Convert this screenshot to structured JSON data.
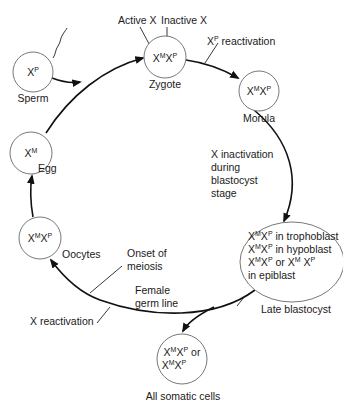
{
  "colors": {
    "line": "#111111",
    "circle_stroke": "#777777",
    "text": "#1a1a1a",
    "background": "#ffffff"
  },
  "nodes": {
    "sperm": {
      "label": "Sperm",
      "genotype": {
        "x1": "X",
        "s1": "P"
      }
    },
    "zygote": {
      "label": "Zygote",
      "genotype": {
        "x1": "X",
        "s1": "M",
        "x2": "X",
        "s2": "P"
      }
    },
    "morula": {
      "label": "Morula",
      "genotype": {
        "x1": "X",
        "s1": "M",
        "x2": "X",
        "s2": "P"
      }
    },
    "egg": {
      "label": "Egg",
      "genotype": {
        "x1": "X",
        "s1": "M"
      }
    },
    "oocytes": {
      "label": "Oocytes",
      "genotype": {
        "x1": "X",
        "s1": "M",
        "x2": "X",
        "s2": "P"
      }
    },
    "late_blastocyst": {
      "label": "Late blastocyst",
      "lines": [
        {
          "x1": "X",
          "s1": "M",
          "x2": "X",
          "s2": "P",
          "text": " in trophoblast"
        },
        {
          "x1": "X",
          "s1": "M",
          "x2": "X",
          "s2": "P",
          "text": " in hypoblast"
        },
        {
          "x1": "X",
          "s1": "M",
          "x2": "X",
          "s2": "P",
          "mid": " or ",
          "x3": "X",
          "s3": "M",
          "x4": " X",
          "s4": "P"
        },
        {
          "text": "in epiblast"
        }
      ]
    },
    "somatic": {
      "label": "All somatic cells",
      "line1": {
        "x1": "X",
        "s1": "M",
        "x2": "X",
        "s2": "P",
        "text": " or"
      },
      "line2": {
        "x1": "X",
        "s1": "M",
        "x2": "X",
        "s2": "P"
      }
    }
  },
  "annotations": {
    "active_x": "Active X",
    "inactive_x": "Inactive X",
    "xp_reactivation": {
      "x": "X",
      "sup": "P",
      "text": " reactivation"
    },
    "x_inactivation": [
      "X inactivation",
      "during",
      "blastocyst",
      "stage"
    ],
    "onset_meiosis": [
      "Onset of",
      "meiosis"
    ],
    "female_germ_line": [
      "Female",
      "germ line"
    ],
    "x_reactivation": "X reactivation"
  }
}
